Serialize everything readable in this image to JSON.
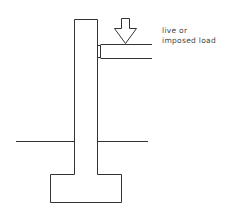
{
  "diagram": {
    "labels": {
      "load_line1": "live or",
      "load_line2": "imposed load"
    },
    "colors": {
      "stroke": "#333333",
      "background": "#ffffff",
      "text": "#444444"
    }
  }
}
